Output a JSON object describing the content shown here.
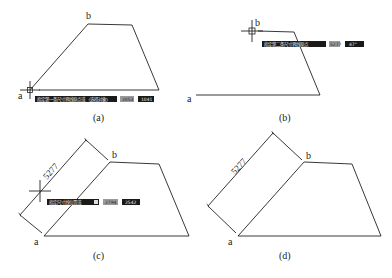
{
  "figure": {
    "panels": [
      {
        "id": "a",
        "caption": "(a)",
        "point_labels": {
          "a": "a",
          "b": "b"
        },
        "prompt": {
          "instruction": "指定第一条尺寸界线原点或 〈选择对象〉",
          "field1": "2053",
          "field2": "1041"
        }
      },
      {
        "id": "b",
        "caption": "(b)",
        "point_labels": {
          "a": "a",
          "b": "b"
        },
        "prompt": {
          "instruction": "指定第二条尺寸界线原点",
          "field1": "5277",
          "field2": "47°"
        }
      },
      {
        "id": "c",
        "caption": "(c)",
        "point_labels": {
          "a": "a",
          "b": "b"
        },
        "dimension_value": "5277",
        "prompt": {
          "instruction": "指定尺寸线位置或",
          "field1": "2794",
          "field2": "2542"
        }
      },
      {
        "id": "d",
        "caption": "(d)",
        "point_labels": {
          "a": "a",
          "b": "b"
        },
        "dimension_value": "5277"
      }
    ]
  }
}
